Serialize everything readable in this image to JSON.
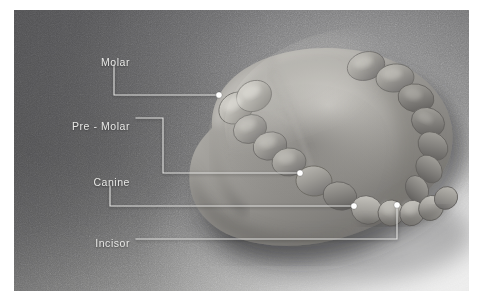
{
  "figure": {
    "plate_background": "#6d6d6d",
    "label_color": "#e8e8e6",
    "leader_color": "#e6e6e4",
    "marker_color": "#ffffff"
  },
  "annotations": [
    {
      "id": "molar",
      "label": "Molar",
      "label_x": 130,
      "label_y": 57,
      "marker_x": 219,
      "marker_y": 95,
      "path": "M 114 65 L 114 95 L 219 95"
    },
    {
      "id": "pre-molar",
      "label": "Pre - Molar",
      "label_x": 130,
      "label_y": 121,
      "marker_x": 300,
      "marker_y": 173,
      "path": "M 136 118 L 163 118 L 163 173 L 300 173"
    },
    {
      "id": "canine",
      "label": "Canine",
      "label_x": 130,
      "label_y": 177,
      "marker_x": 354,
      "marker_y": 206,
      "path": "M 110 186 L 110 206 L 354 206"
    },
    {
      "id": "incisor",
      "label": "Incisor",
      "label_x": 130,
      "label_y": 238,
      "marker_x": 397,
      "marker_y": 205,
      "path": "M 136 239 L 397 239 L 397 205"
    }
  ]
}
